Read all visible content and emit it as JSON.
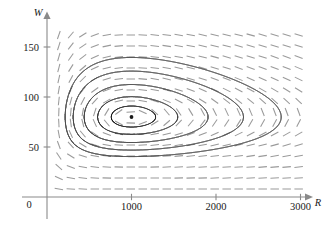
{
  "figure": {
    "name": "predator-prey-phase-portrait",
    "background_color": "#ffffff"
  },
  "axes": {
    "x_axis": {
      "label": "R",
      "tick_labels": [
        "1000",
        "2000",
        "3000"
      ],
      "tick_values": [
        1000,
        2000,
        3000
      ],
      "range": [
        0,
        3200
      ],
      "origin_label": "0",
      "arrow": true,
      "color": "#8a8a8a"
    },
    "y_axis": {
      "label": "W",
      "tick_labels": [
        "50",
        "100",
        "150"
      ],
      "tick_values": [
        50,
        100,
        150
      ],
      "range": [
        0,
        170
      ],
      "arrow": true,
      "color": "#8a8a8a"
    }
  },
  "chart_data": {
    "type": "line",
    "title": "",
    "xlabel": "R",
    "ylabel": "W",
    "xlim": [
      0,
      3200
    ],
    "ylim": [
      0,
      170
    ],
    "grid": false,
    "legend": "none",
    "plot_kind": "phase-plane-direction-field-with-closed-orbits",
    "equilibrium_point": {
      "R": 1000,
      "W": 80,
      "label": ""
    },
    "direction_field": {
      "style": "dashes",
      "color": "#9a9a9a",
      "model": "lotka-volterra",
      "dR_dt": "0.08*R - 0.001*R*W",
      "dW_dt": "-0.02*W + 0.00002*R*W",
      "grid_columns": 22,
      "grid_rows": 15,
      "R_min": 140,
      "R_max": 3120,
      "W_min": 8,
      "W_max": 162,
      "segment_length_px": 8.5
    },
    "orbits": [
      {
        "name": "orbit-1-innermost",
        "scale": 0.13,
        "W_top": 88,
        "W_bottom": 72,
        "R_left": 760,
        "R_right": 1260
      },
      {
        "name": "orbit-2",
        "scale": 0.34,
        "W_top": 97,
        "W_bottom": 64,
        "R_left": 600,
        "R_right": 1560
      },
      {
        "name": "orbit-3",
        "scale": 0.62,
        "W_top": 105,
        "W_bottom": 55,
        "R_left": 440,
        "R_right": 1960
      },
      {
        "name": "orbit-4",
        "scale": 0.96,
        "W_top": 120,
        "W_bottom": 48,
        "R_left": 310,
        "R_right": 2360
      },
      {
        "name": "orbit-5-outermost",
        "scale": 1.42,
        "W_top": 140,
        "W_bottom": 42,
        "R_left": 215,
        "R_right": 2800
      }
    ],
    "series": [
      {
        "name": "orbit-1-innermost",
        "values": [
          [
            760,
            80
          ],
          [
            1000,
            88
          ],
          [
            1260,
            80
          ],
          [
            1000,
            72
          ]
        ]
      },
      {
        "name": "orbit-2",
        "values": [
          [
            600,
            80
          ],
          [
            1000,
            97
          ],
          [
            1560,
            80
          ],
          [
            1000,
            64
          ]
        ]
      },
      {
        "name": "orbit-3",
        "values": [
          [
            440,
            80
          ],
          [
            1000,
            105
          ],
          [
            1960,
            80
          ],
          [
            1000,
            55
          ]
        ]
      },
      {
        "name": "orbit-4",
        "values": [
          [
            310,
            80
          ],
          [
            950,
            120
          ],
          [
            2360,
            80
          ],
          [
            1000,
            48
          ]
        ]
      },
      {
        "name": "orbit-5-outermost",
        "values": [
          [
            215,
            80
          ],
          [
            900,
            140
          ],
          [
            2800,
            80
          ],
          [
            1000,
            42
          ]
        ]
      }
    ]
  }
}
